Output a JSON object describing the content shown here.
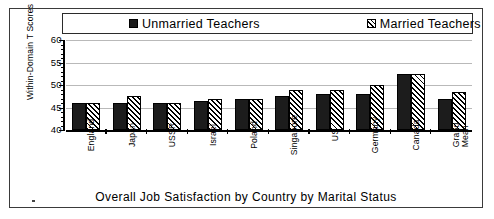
{
  "chart_data": {
    "type": "bar",
    "title": "",
    "xlabel": "Overall  Job  Satisfaction  by  Country  by  Marital  Status",
    "ylabel": "Within-Domain T Scores",
    "ylim": [
      40,
      60
    ],
    "yticks": [
      40,
      45,
      50,
      55,
      60
    ],
    "grid": true,
    "legend_position": "top",
    "categories": [
      "England",
      "Japan",
      "USSR",
      "Israel",
      "Poland",
      "Singapore",
      "US",
      "Germany",
      "Canada",
      "Grand\nMean"
    ],
    "series": [
      {
        "name": "Unmarried  Teachers",
        "swatch": "solid-black",
        "values": [
          46,
          46,
          46,
          46.5,
          47,
          47.5,
          48,
          48,
          52.5,
          47
        ]
      },
      {
        "name": "Married  Teachers",
        "swatch": "diagonal-hatch",
        "values": [
          46,
          47.5,
          46,
          47,
          47,
          49,
          49,
          50,
          52.5,
          48.5
        ]
      }
    ]
  },
  "legend": {
    "unmarried_label": "Unmarried  Teachers",
    "married_label": "Married  Teachers"
  },
  "axis": {
    "y_title": "Within-Domain T Scores",
    "tick_60": "60",
    "tick_55": "55",
    "tick_50": "50",
    "tick_45": "45",
    "tick_40": "40"
  },
  "caption": "Overall  Job  Satisfaction  by  Country  by  Marital  Status",
  "colors": {
    "unmarried": "#1c1c1c",
    "married": "#000000",
    "gridline": "#b9b9b9",
    "frame": "#3a3a3a"
  }
}
